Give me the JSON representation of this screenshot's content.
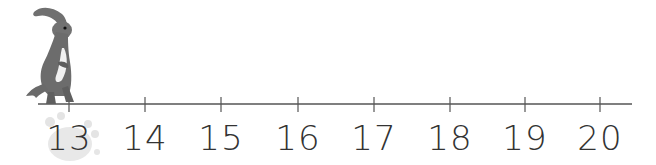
{
  "number_line": {
    "start": 13,
    "end": 20,
    "ticks": [
      "13",
      "14",
      "15",
      "16",
      "17",
      "18",
      "19",
      "20"
    ],
    "tick_x": [
      69,
      145,
      221,
      298,
      374,
      450,
      525,
      600
    ],
    "line": {
      "x1": 38,
      "x2": 632,
      "y": 104
    },
    "line_color": "#555555",
    "label_color": "#333333",
    "highlighted_value": "13"
  },
  "figure": {
    "icon": "dinosaur-icon",
    "position_value": "13",
    "body_color": "#6f6f6f",
    "belly_color": "#f2f2f2"
  },
  "highlight": {
    "icon": "pawprint-icon",
    "color": "#e6e6e6"
  }
}
